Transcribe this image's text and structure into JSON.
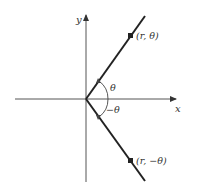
{
  "diagram": {
    "axes": {
      "x_label": "x",
      "y_label": "y"
    },
    "points": [
      {
        "label": "(r, θ)",
        "position": "upper-ray"
      },
      {
        "label": "(r, −θ)",
        "position": "lower-ray"
      }
    ],
    "angles": [
      {
        "label": "θ",
        "direction": "counterclockwise"
      },
      {
        "label": "−θ",
        "direction": "clockwise"
      }
    ],
    "colors": {
      "line": "#222222",
      "axis": "#555555",
      "text": "#333333"
    }
  }
}
